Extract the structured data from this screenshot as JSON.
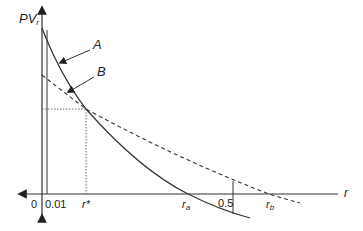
{
  "diagram": {
    "y_axis_label": "PV",
    "y_axis_subscript": "r",
    "x_axis_label": "r",
    "curve_a_label": "A",
    "curve_b_label": "B",
    "ticks": {
      "origin": "0",
      "r_min": "0.01",
      "r_star": "r*",
      "r_a": "r",
      "r_a_sub": "a",
      "half": "0.5",
      "r_b": "r",
      "r_b_sub": "b"
    },
    "colors": {
      "line": "#333333",
      "background": "#ffffff"
    }
  }
}
